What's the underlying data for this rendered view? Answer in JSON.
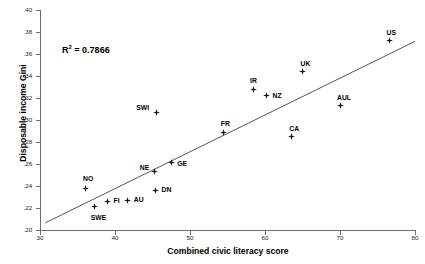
{
  "chart_data": {
    "type": "scatter",
    "title": "",
    "xlabel": "Combined civic literacy score",
    "ylabel": "Disposable income Gini",
    "xlim": [
      30,
      80
    ],
    "ylim": [
      0.2,
      0.4
    ],
    "xticks": [
      "30",
      "40",
      "50",
      "60",
      "70",
      "80"
    ],
    "xtick_values": [
      30,
      40,
      50,
      60,
      70,
      80
    ],
    "yticks": [
      ".40",
      ".38",
      ".36",
      ".34",
      ".32",
      ".30",
      ".28",
      ".26",
      ".24",
      ".22",
      ".20"
    ],
    "ytick_values": [
      0.4,
      0.38,
      0.36,
      0.34,
      0.32,
      0.3,
      0.28,
      0.26,
      0.24,
      0.22,
      0.2
    ],
    "grid": false,
    "legend": "none",
    "annotations": [
      {
        "name": "r-squared",
        "text": "R2 = 0.7866",
        "value": 0.7866,
        "x": 37,
        "y": 0.365
      }
    ],
    "trendline": {
      "type": "linear",
      "x_start": 30.7,
      "y_start": 0.2065,
      "x_end": 80.0,
      "y_end": 0.3715
    },
    "points": [
      {
        "label": "NO",
        "x": 36.0,
        "y": 0.238,
        "label_dx": -2,
        "label_dy": -13
      },
      {
        "label": "SWE",
        "x": 37.3,
        "y": 0.221,
        "label_dx": -4,
        "label_dy": 7
      },
      {
        "label": "FI",
        "x": 39.0,
        "y": 0.226,
        "label_dx": 6,
        "label_dy": -4
      },
      {
        "label": "AU",
        "x": 41.7,
        "y": 0.227,
        "label_dx": 6,
        "label_dy": -4
      },
      {
        "label": "NE",
        "x": 45.3,
        "y": 0.253,
        "label_dx": -15,
        "label_dy": -8
      },
      {
        "label": "DN",
        "x": 45.4,
        "y": 0.236,
        "label_dx": 6,
        "label_dy": -4
      },
      {
        "label": "SWI",
        "x": 45.5,
        "y": 0.307,
        "label_dx": -20,
        "label_dy": -8
      },
      {
        "label": "GE",
        "x": 47.5,
        "y": 0.261,
        "label_dx": 6,
        "label_dy": -3
      },
      {
        "label": "FR",
        "x": 54.5,
        "y": 0.289,
        "label_dx": -3,
        "label_dy": -12
      },
      {
        "label": "IR",
        "x": 58.4,
        "y": 0.328,
        "label_dx": -3,
        "label_dy": -12
      },
      {
        "label": "NZ",
        "x": 60.2,
        "y": 0.322,
        "label_dx": 6,
        "label_dy": -4
      },
      {
        "label": "CA",
        "x": 63.5,
        "y": 0.285,
        "label_dx": -2,
        "label_dy": -12
      },
      {
        "label": "UK",
        "x": 65.0,
        "y": 0.344,
        "label_dx": -2,
        "label_dy": -12
      },
      {
        "label": "AUL",
        "x": 70.0,
        "y": 0.313,
        "label_dx": -3,
        "label_dy": -12
      },
      {
        "label": "US",
        "x": 76.6,
        "y": 0.372,
        "label_dx": -3,
        "label_dy": -12
      }
    ],
    "colors": {
      "marker": "#111111",
      "line": "#555555",
      "axis": "#6e6e6e",
      "text": "#000000",
      "background": "#ffffff"
    }
  }
}
